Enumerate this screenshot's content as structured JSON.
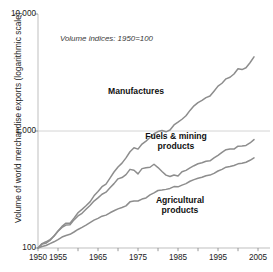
{
  "chart_data": {
    "type": "line",
    "title": "",
    "subtitle": "",
    "annotation": "Volume indices: 1950=100",
    "xlabel": "",
    "ylabel": "Volume of world merchandise exports (logarithmic scale)",
    "yscale": "log",
    "ylim": [
      100,
      10000
    ],
    "xlim": [
      1950,
      2005
    ],
    "grid": true,
    "grid_lines": [
      1000
    ],
    "legend_position": "inline-labels",
    "yticks": [
      100,
      1000,
      10000
    ],
    "ytick_labels": [
      "100",
      "1,000",
      "10,000"
    ],
    "xticks": [
      1950,
      1955,
      1960,
      1965,
      1970,
      1975,
      1980,
      1985,
      1990,
      1995,
      2000,
      2005
    ],
    "xtick_labels_shown": [
      "1950",
      "1955",
      "1965",
      "1975",
      "1985",
      "1995",
      "2005"
    ],
    "line_color": "#8d8d8d",
    "series": [
      {
        "name": "Manufactures",
        "label_x": 1974.5,
        "label_y": 2150,
        "x": [
          1950,
          1951,
          1952,
          1953,
          1954,
          1955,
          1956,
          1957,
          1958,
          1959,
          1960,
          1961,
          1962,
          1963,
          1964,
          1965,
          1966,
          1967,
          1968,
          1969,
          1970,
          1971,
          1972,
          1973,
          1974,
          1975,
          1976,
          1977,
          1978,
          1979,
          1980,
          1981,
          1982,
          1983,
          1984,
          1985,
          1986,
          1987,
          1988,
          1989,
          1990,
          1991,
          1992,
          1993,
          1994,
          1995,
          1996,
          1997,
          1998,
          1999,
          2000,
          2001,
          2002,
          2003,
          2004
        ],
        "values": [
          100,
          108,
          110,
          116,
          127,
          140,
          153,
          163,
          163,
          180,
          200,
          214,
          230,
          248,
          279,
          304,
          334,
          352,
          396,
          446,
          492,
          531,
          589,
          665,
          718,
          700,
          773,
          820,
          879,
          947,
          989,
          1010,
          984,
          1020,
          1127,
          1190,
          1260,
          1350,
          1500,
          1640,
          1750,
          1830,
          1930,
          1990,
          2190,
          2420,
          2560,
          2790,
          2880,
          3070,
          3400,
          3350,
          3470,
          3830,
          4300
        ]
      },
      {
        "name": "Fuels & mining products",
        "label_x": 1984.5,
        "label_y": 880,
        "x": [
          1950,
          1951,
          1952,
          1953,
          1954,
          1955,
          1956,
          1957,
          1958,
          1959,
          1960,
          1961,
          1962,
          1963,
          1964,
          1965,
          1966,
          1967,
          1968,
          1969,
          1970,
          1971,
          1972,
          1973,
          1974,
          1975,
          1976,
          1977,
          1978,
          1979,
          1980,
          1981,
          1982,
          1983,
          1984,
          1985,
          1986,
          1987,
          1988,
          1989,
          1990,
          1991,
          1992,
          1993,
          1994,
          1995,
          1996,
          1997,
          1998,
          1999,
          2000,
          2001,
          2002,
          2003,
          2004
        ],
        "values": [
          100,
          109,
          113,
          118,
          126,
          139,
          150,
          157,
          158,
          174,
          188,
          198,
          214,
          231,
          252,
          268,
          288,
          300,
          327,
          355,
          390,
          400,
          424,
          470,
          462,
          430,
          477,
          486,
          490,
          520,
          487,
          451,
          420,
          408,
          421,
          413,
          448,
          461,
          484,
          505,
          525,
          536,
          551,
          556,
          588,
          620,
          657,
          692,
          702,
          700,
          742,
          745,
          752,
          790,
          845
        ]
      },
      {
        "name": "Agricultural products",
        "label_x": 1985.5,
        "label_y": 250,
        "x": [
          1950,
          1951,
          1952,
          1953,
          1954,
          1955,
          1956,
          1957,
          1958,
          1959,
          1960,
          1961,
          1962,
          1963,
          1964,
          1965,
          1966,
          1967,
          1968,
          1969,
          1970,
          1971,
          1972,
          1973,
          1974,
          1975,
          1976,
          1977,
          1978,
          1979,
          1980,
          1981,
          1982,
          1983,
          1984,
          1985,
          1986,
          1987,
          1988,
          1989,
          1990,
          1991,
          1992,
          1993,
          1994,
          1995,
          1996,
          1997,
          1998,
          1999,
          2000,
          2001,
          2002,
          2003,
          2004
        ],
        "values": [
          100,
          103,
          105,
          109,
          113,
          118,
          124,
          128,
          131,
          137,
          144,
          150,
          157,
          165,
          173,
          179,
          187,
          191,
          200,
          208,
          216,
          222,
          229,
          248,
          252,
          252,
          262,
          268,
          284,
          296,
          310,
          313,
          317,
          323,
          335,
          333,
          345,
          355,
          372,
          384,
          394,
          402,
          414,
          420,
          434,
          455,
          470,
          491,
          497,
          507,
          524,
          531,
          541,
          562,
          590
        ]
      }
    ]
  },
  "axis": {
    "ylabel": "Volume of world merchandise exports (logarithmic scale)"
  }
}
